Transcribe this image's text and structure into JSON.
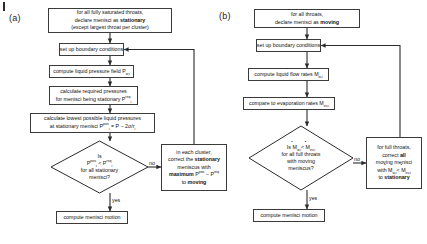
{
  "figure": {
    "panels": [
      {
        "id": "a",
        "label": "(a)",
        "nodes": {
          "start": {
            "line1": "for all fully saturated throats,",
            "line2_pre": "declare menisci as ",
            "line2_bold": "stationary",
            "line3": "(except largest throat per cluster)"
          },
          "boundary": "set up boundary conditions",
          "pressure_field": {
            "text": "compute liquid pressure field P",
            "sub": "w,i"
          },
          "required": {
            "line1": "calculate required pressures",
            "line2": "for menisci being stationary P",
            "line2_sup": "req",
            "line2_sub": "i"
          },
          "lowest": {
            "line1": "calculate lowest possible liquid pressures",
            "line2_a": "at stationary menisci P",
            "line2_sup": "pos",
            "line2_sub": "i",
            "line2_b": " = P − 2σ/r",
            "line2_sub2": "i"
          },
          "decision": {
            "line1": "Is",
            "line2_a": "P",
            "line2_sup_a": "pos",
            "line2_sub_a": "i",
            "line2_mid": " < P",
            "line2_sup_b": "req",
            "line2_sub_b": "i",
            "line3": "for all stationary",
            "line4": "menisci?"
          },
          "correct": {
            "line1": "in each cluster,",
            "line2_pre": "correct the ",
            "line2_bold": "stationary",
            "line3": "meniscus with",
            "line4_bold": "maximum",
            "line4_a": " P",
            "line4_sup_a": "pos",
            "line4_mid": " − P",
            "line4_sup_b": "req",
            "line5_pre": "to ",
            "line5_bold": "moving"
          },
          "end": "compute menisci motion"
        },
        "edges": {
          "no": "no",
          "yes": "yes"
        }
      },
      {
        "id": "b",
        "label": "(b)",
        "nodes": {
          "start": {
            "line1": "for all throats,",
            "line2_pre": "declare menisci as ",
            "line2_bold": "moving"
          },
          "boundary": "set up boundary conditions",
          "flow_rates": {
            "text": "compute liquid flow rates M",
            "sub": "w,i"
          },
          "evap_rates": {
            "text": "compare to evaporation rates M",
            "sub": "ev,i"
          },
          "decision": {
            "line1_a": "Is M",
            "line1_sub_a": "w,i",
            "line1_mid": " < M",
            "line1_sub_b": "ev,i",
            "line2": "for all full throats",
            "line3": "with moving",
            "line4": "meniscus?"
          },
          "correct": {
            "line1": "for full throats,",
            "line2_pre": "correct ",
            "line2_bold": "all",
            "line3": "moving menisci",
            "line4_a": "with M",
            "line4_sub_a": "w,i",
            "line4_mid": " < M",
            "line4_sub_b": "ev,i",
            "line5_pre": "to ",
            "line5_bold": "stationary"
          },
          "end": "compute menisci motion"
        },
        "edges": {
          "no": "no",
          "yes": "yes"
        }
      }
    ]
  }
}
